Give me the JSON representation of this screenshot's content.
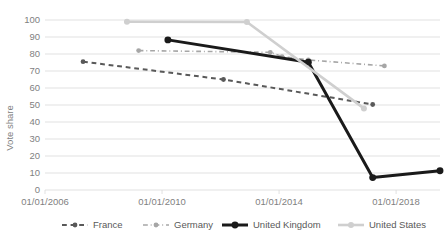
{
  "chart_data": {
    "type": "line",
    "title": "",
    "xlabel": "",
    "ylabel": "Vote share",
    "ylim": [
      0,
      100
    ],
    "ytick_step": 10,
    "yticks": [
      "0",
      "10",
      "20",
      "30",
      "40",
      "50",
      "60",
      "70",
      "80",
      "90",
      "100"
    ],
    "xticks": [
      "01/01/2006",
      "01/01/2010",
      "01/01/2014",
      "01/01/2018"
    ],
    "xtick_years": [
      2006,
      2010,
      2014,
      2018
    ],
    "xlim_years": [
      2006,
      2019.5
    ],
    "grid": "horizontal",
    "legend_position": "bottom",
    "series": [
      {
        "name": "France",
        "color": "#595959",
        "style": "dashed",
        "width": 2.0,
        "marker": "circle",
        "points": [
          {
            "year": 2007.3,
            "value": 75.5
          },
          {
            "year": 2012.1,
            "value": 65.0
          },
          {
            "year": 2017.2,
            "value": 50.3
          }
        ]
      },
      {
        "name": "Germany",
        "color": "#a6a6a6",
        "style": "dashdot",
        "width": 1.6,
        "marker": "circle",
        "points": [
          {
            "year": 2009.2,
            "value": 82.0
          },
          {
            "year": 2013.7,
            "value": 81.0
          },
          {
            "year": 2014.1,
            "value": 78.5
          },
          {
            "year": 2015.0,
            "value": 76.5
          },
          {
            "year": 2017.6,
            "value": 73.0
          }
        ]
      },
      {
        "name": "United Kingdom",
        "color": "#1a1a1a",
        "style": "solid",
        "width": 3.0,
        "marker": "circle",
        "points": [
          {
            "year": 2010.2,
            "value": 88.3
          },
          {
            "year": 2015.0,
            "value": 75.2
          },
          {
            "year": 2017.2,
            "value": 7.3
          },
          {
            "year": 2019.5,
            "value": 11.3
          }
        ]
      },
      {
        "name": "United States",
        "color": "#cfcfcf",
        "style": "solid",
        "width": 2.6,
        "marker": "circle",
        "points": [
          {
            "year": 2008.8,
            "value": 99.0
          },
          {
            "year": 2012.9,
            "value": 98.8
          },
          {
            "year": 2016.9,
            "value": 48.0
          }
        ]
      }
    ],
    "legend_entries": [
      {
        "label": "France",
        "color": "#595959",
        "style": "dashed",
        "width": 2.0
      },
      {
        "label": "Germany",
        "color": "#a6a6a6",
        "style": "dashdot",
        "width": 1.6
      },
      {
        "label": "United Kingdom",
        "color": "#1a1a1a",
        "style": "solid",
        "width": 3.0
      },
      {
        "label": "United States",
        "color": "#cfcfcf",
        "style": "solid",
        "width": 2.6
      }
    ]
  }
}
